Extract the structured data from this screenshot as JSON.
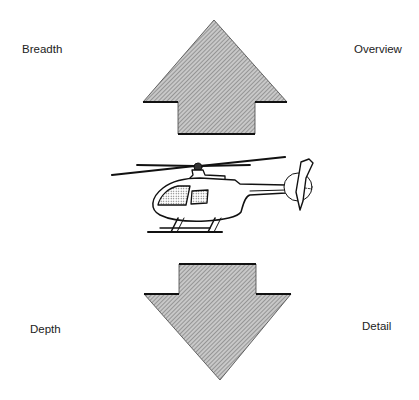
{
  "diagram": {
    "labels": {
      "top_left": "Breadth",
      "top_right": "Overview",
      "bottom_left": "Depth",
      "bottom_right": "Detail"
    },
    "elements": [
      {
        "type": "arrow",
        "direction": "up",
        "fill": "hatched-gray"
      },
      {
        "type": "illustration",
        "subject": "helicopter"
      },
      {
        "type": "arrow",
        "direction": "down",
        "fill": "hatched-gray"
      }
    ],
    "colors": {
      "arrow_fill": "#b8b8b8",
      "stroke": "#222222",
      "background": "#ffffff"
    }
  }
}
